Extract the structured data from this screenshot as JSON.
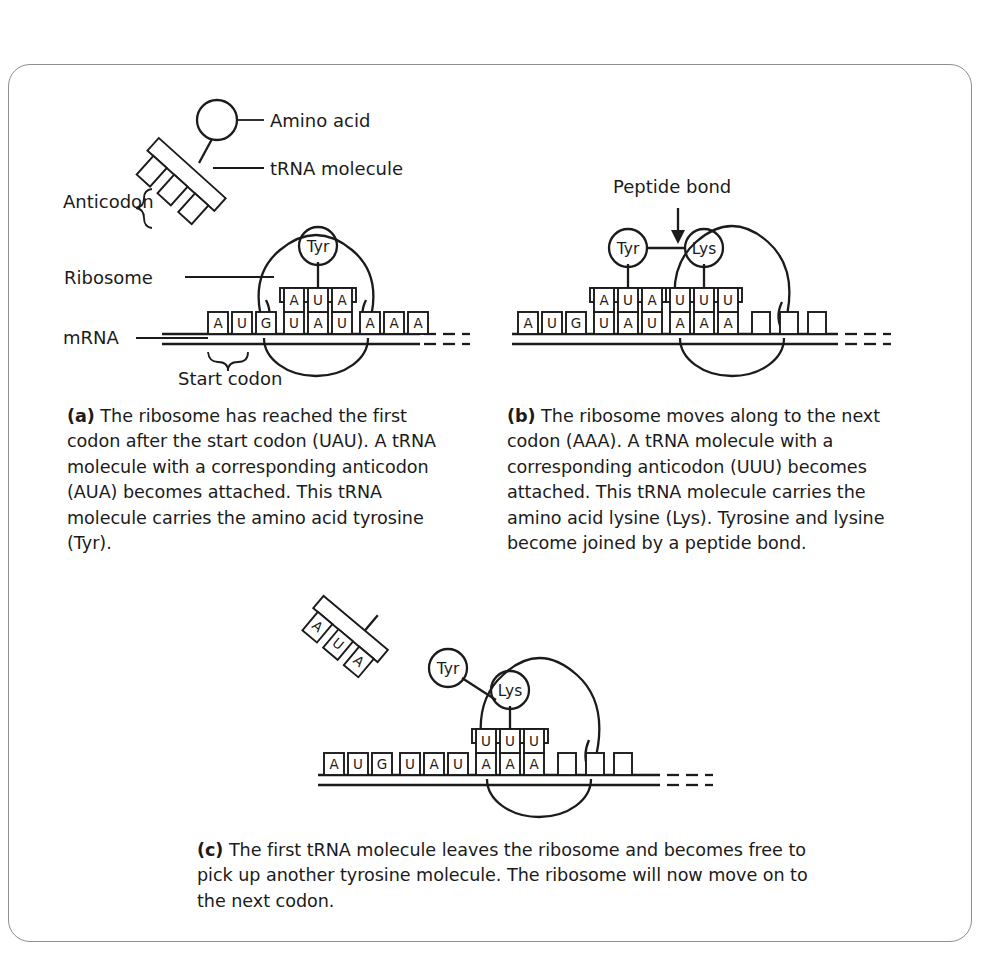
{
  "figure": {
    "border_color": "#8d8f92",
    "ink_color": "#1b1b1b",
    "background": "#ffffff"
  },
  "legend_labels": {
    "amino_acid": "Amino acid",
    "trna_molecule": "tRNA molecule",
    "anticodon": "Anticodon",
    "ribosome": "Ribosome",
    "mrna": "mRNA",
    "start_codon": "Start codon",
    "peptide_bond": "Peptide bond"
  },
  "key_trna": {
    "anticodon_bases": [
      "",
      "",
      ""
    ],
    "amino_acid_label": ""
  },
  "panels": [
    {
      "id": "a",
      "tag": "(a)",
      "caption": "The ribosome has reached the first codon after the start codon (UAU). A tRNA molecule with a corresponding anticodon (AUA) becomes attached. This tRNA molecule carries the amino acid tyrosine (Tyr).",
      "mrna_bases": [
        "A",
        "U",
        "G",
        "U",
        "A",
        "U",
        "A",
        "A",
        "A"
      ],
      "empty_boxes": 0,
      "trnas": [
        {
          "amino_acid": "Tyr",
          "anticodon": [
            "A",
            "U",
            "A"
          ],
          "codon_index": 3
        }
      ]
    },
    {
      "id": "b",
      "tag": "(b)",
      "caption": "The ribosome moves along to the next codon (AAA). A tRNA molecule with a corresponding anticodon (UUU) becomes attached. This tRNA molecule carries the amino acid lysine (Lys). Tyrosine and lysine become joined by a peptide bond.",
      "mrna_bases": [
        "A",
        "U",
        "G",
        "U",
        "A",
        "U",
        "A",
        "A",
        "A"
      ],
      "empty_boxes": 3,
      "trnas": [
        {
          "amino_acid": "Tyr",
          "anticodon": [
            "A",
            "U",
            "A"
          ],
          "codon_index": 3
        },
        {
          "amino_acid": "Lys",
          "anticodon": [
            "U",
            "U",
            "U"
          ],
          "codon_index": 6
        }
      ]
    },
    {
      "id": "c",
      "tag": "(c)",
      "caption": "The first tRNA molecule leaves the ribosome and becomes free to pick up another tyrosine molecule. The ribosome will now move on to the next codon.",
      "mrna_bases": [
        "A",
        "U",
        "G",
        "U",
        "A",
        "U",
        "A",
        "A",
        "A"
      ],
      "empty_boxes": 3,
      "free_trna_anticodon": [
        "A",
        "U",
        "A"
      ],
      "trnas": [
        {
          "amino_acid": "Lys",
          "anticodon": [
            "U",
            "U",
            "U"
          ],
          "codon_index": 6
        }
      ],
      "detached_amino_acid": "Tyr"
    }
  ]
}
